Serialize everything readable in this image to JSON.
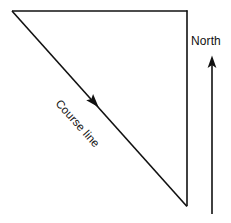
{
  "diagram": {
    "background_color": "#ffffff",
    "line_color": "#111111",
    "labels": {
      "course_line": "Course line",
      "north": "North"
    },
    "geometry": {
      "top_left_vertex": [
        12,
        11
      ],
      "top_right_vertex": [
        187,
        11
      ],
      "bottom_vertex": [
        187,
        206
      ],
      "top_edge": {
        "x1": 12,
        "y1": 11,
        "x2": 187,
        "y2": 11
      },
      "right_edge": {
        "x1": 187,
        "y1": 11,
        "x2": 187,
        "y2": 206
      },
      "course_line": {
        "x1": 12,
        "y1": 11,
        "x2": 187,
        "y2": 206
      },
      "north_arrow": {
        "x1": 212,
        "y1": 214,
        "x2": 212,
        "y2": 57
      }
    },
    "course_line_arrow": {
      "name": "course-direction-arrowhead",
      "position": [
        94,
        102
      ],
      "direction": "down-right",
      "angle_degrees": 48.1
    },
    "north_arrow_head": {
      "name": "north-arrowhead",
      "position": [
        212,
        57
      ],
      "direction": "up"
    },
    "course_label_rotation_degrees": 48.1
  }
}
